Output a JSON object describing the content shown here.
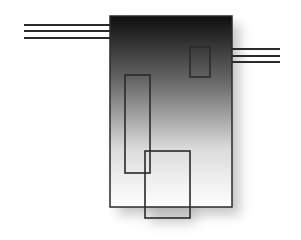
{
  "diagram": {
    "type": "abstract-block-diagram",
    "colors": {
      "background": "#ffffff",
      "stroke": "#2a2a2a",
      "gradient_top": "#111111",
      "gradient_bottom": "#ffffff",
      "shadow": "#9a9a9a"
    },
    "main_block": {
      "x": 110,
      "y": 16,
      "width": 122,
      "height": 191
    },
    "left_lines": {
      "x1": 24,
      "x2": 110,
      "ys": [
        25,
        31,
        38
      ]
    },
    "right_lines": {
      "x1": 232,
      "x2": 280,
      "ys": [
        49,
        56,
        62
      ]
    },
    "inner_rects": [
      {
        "name": "small-rect",
        "x": 190,
        "y": 47,
        "width": 20,
        "height": 30
      },
      {
        "name": "tall-rect",
        "x": 125,
        "y": 75,
        "width": 25,
        "height": 98
      },
      {
        "name": "bottom-rect",
        "x": 145,
        "y": 151,
        "width": 45,
        "height": 67
      }
    ]
  }
}
